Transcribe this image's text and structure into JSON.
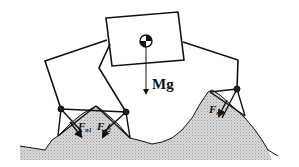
{
  "diagram": {
    "type": "walking robot free-body diagram",
    "body_label": "Mg",
    "forces": [
      {
        "id": "n1",
        "label": "F",
        "subscript": "n1"
      },
      {
        "id": "n2",
        "label": "F",
        "subscript": "n2"
      },
      {
        "id": "n3",
        "label": "F",
        "subscript": "n3"
      }
    ],
    "colors": {
      "line": "#111111",
      "terrain": "#cfcfcf",
      "background": "#ffffff"
    }
  }
}
